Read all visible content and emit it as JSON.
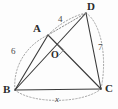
{
  "figure": {
    "kind": "geometry-diagram",
    "stroke_color": "#3a3a3a",
    "dotted_color": "#9a9a9a",
    "background": "#fdfdfd"
  },
  "vertices": [
    {
      "name": "A",
      "label": "A",
      "x": 48,
      "y": 35,
      "label_x": 33,
      "label_y": 23
    },
    {
      "name": "B",
      "label": "B",
      "x": 15,
      "y": 90,
      "label_x": 3,
      "label_y": 87
    },
    {
      "name": "C",
      "label": "C",
      "x": 101,
      "y": 89,
      "label_x": 105,
      "label_y": 86
    },
    {
      "name": "D",
      "label": "D",
      "x": 86,
      "y": 13,
      "label_x": 87,
      "label_y": 1
    },
    {
      "name": "O",
      "label": "O",
      "x": 57,
      "y": 52,
      "label_x": 52,
      "label_y": 50
    }
  ],
  "segments": [
    {
      "name": "B-A",
      "from": "B",
      "to": "A",
      "style": "solid"
    },
    {
      "name": "B-D",
      "from": "B",
      "to": "D",
      "style": "solid"
    },
    {
      "name": "B-C",
      "from": "B",
      "to": "C",
      "style": "solid"
    },
    {
      "name": "A-C",
      "from": "A",
      "to": "C",
      "style": "solid"
    },
    {
      "name": "D-C",
      "from": "D",
      "to": "C",
      "style": "solid"
    },
    {
      "name": "A-D",
      "from": "A",
      "to": "D",
      "style": "dotted"
    }
  ],
  "arcs": [
    {
      "name": "arc-B-A",
      "label": "6"
    },
    {
      "name": "arc-A-D",
      "label": "4"
    },
    {
      "name": "arc-D-C",
      "label": "7"
    },
    {
      "name": "arc-B-C",
      "label": "x"
    }
  ],
  "measure_labels": [
    {
      "name": "length-4",
      "text": "4",
      "x": 60,
      "y": 19,
      "italic": false
    },
    {
      "name": "length-6",
      "text": "6",
      "x": 12,
      "y": 51,
      "italic": false
    },
    {
      "name": "length-7",
      "text": "7",
      "x": 99,
      "y": 47,
      "italic": false
    },
    {
      "name": "length-x",
      "text": "x",
      "x": 56,
      "y": 98,
      "italic": true
    }
  ],
  "markers": [
    {
      "name": "right-angle-at-O",
      "type": "right-angle",
      "at": "O"
    }
  ]
}
